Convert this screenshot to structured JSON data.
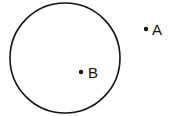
{
  "diagram": {
    "circle": {
      "cx": 65,
      "cy": 58,
      "r": 55,
      "stroke": "#111111"
    },
    "points": [
      {
        "label": "A",
        "x": 146,
        "y": 29
      },
      {
        "label": "B",
        "x": 81,
        "y": 72
      }
    ]
  }
}
